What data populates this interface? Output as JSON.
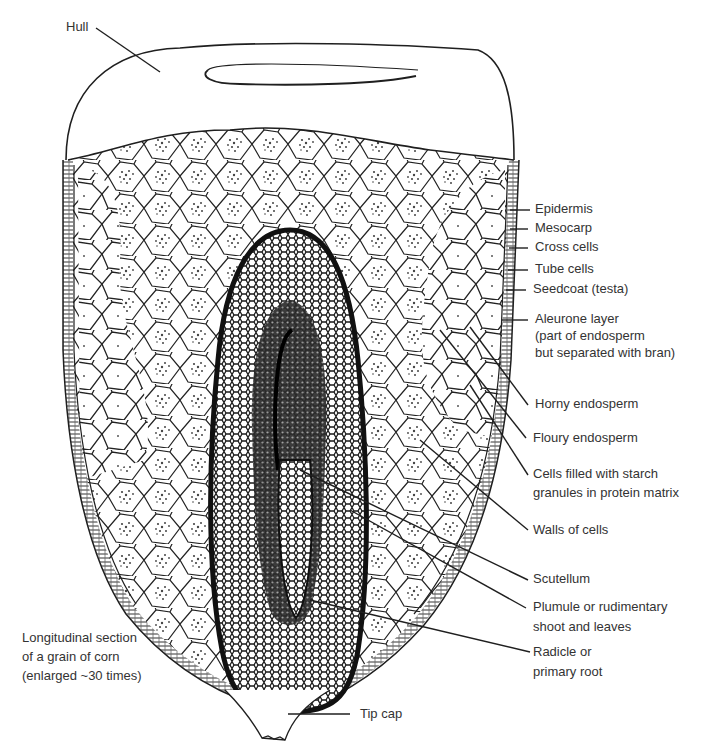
{
  "figure": {
    "caption": [
      "Longitudinal section",
      "of a grain of corn",
      "(enlarged ~30 times)"
    ],
    "colors": {
      "ink": "#1f1f1f",
      "paper": "#ffffff",
      "embryo_dark": "#141414",
      "label_text": "#333333"
    }
  },
  "labels": {
    "hull": "Hull",
    "epidermis": "Epidermis",
    "mesocarp": "Mesocarp",
    "cross_cells": "Cross cells",
    "tube_cells": "Tube cells",
    "seedcoat": "Seedcoat (testa)",
    "aleurone": [
      "Aleurone layer",
      "(part of endosperm",
      "but separated with bran)"
    ],
    "horny_endosperm": "Horny endosperm",
    "floury_endosperm": "Floury endosperm",
    "starch_cells": [
      "Cells filled with starch",
      "granules in protein matrix"
    ],
    "walls_of_cells": "Walls of cells",
    "scutellum": "Scutellum",
    "plumule": [
      "Plumule or rudimentary",
      "shoot and leaves"
    ],
    "radicle": [
      "Radicle or",
      "primary root"
    ],
    "tip_cap": "Tip cap"
  }
}
